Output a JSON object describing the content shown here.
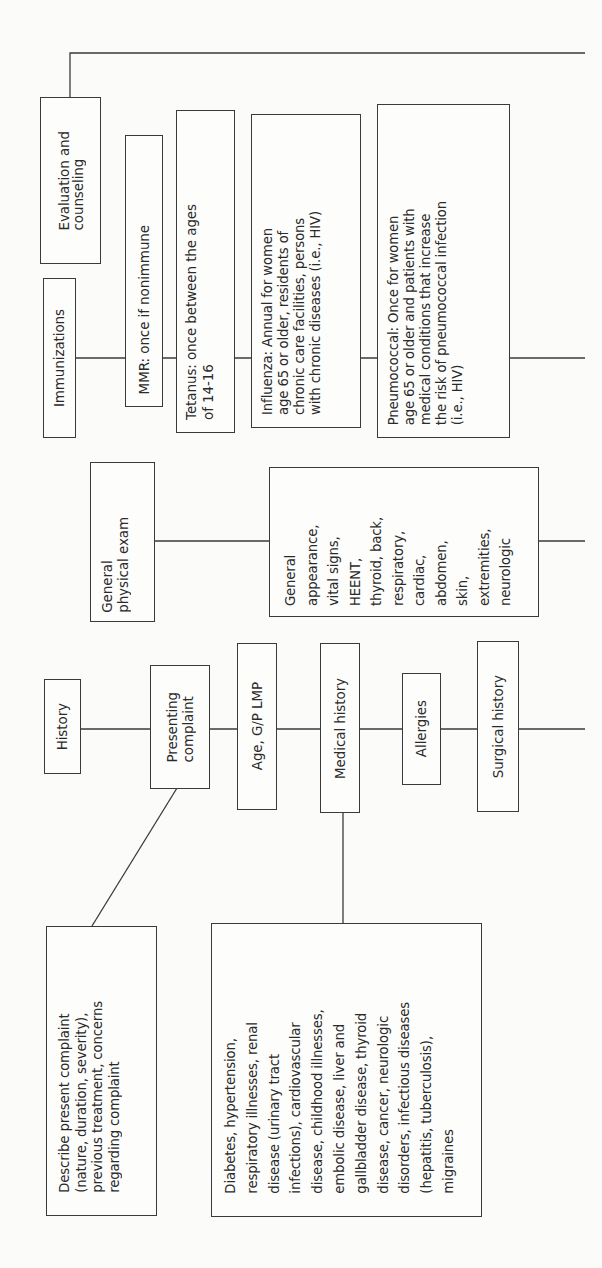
{
  "diagram": {
    "orientation": "rotated-90-ccw",
    "branches": [
      {
        "id": "evaluation",
        "title": "Evaluation and\ncounseling"
      },
      {
        "id": "immunizations",
        "title": "Immunizations",
        "items": [
          "MMR:  once if nonimmune",
          "Tetanus:  once between the ages\nof 14-16",
          "Influenza:  Annual for women\nage 65 or older,   residents of\nchronic care facilities, persons\nwith chronic diseases (i.e., HIV)",
          "Pneumococcal:  Once for women\nage 65 or older and patients with\nmedical conditions that increase\nthe risk of pneumococcal infection\n(i.e., HIV)"
        ]
      },
      {
        "id": "physical-exam",
        "title": "General\nphysical exam",
        "items": [
          "General\nappearance,\nvital signs,\nHEENT,\nthyroid, back,\nrespiratory,\ncardiac,\nabdomen,\nskin,\nextremities,\nneurologic"
        ]
      },
      {
        "id": "history",
        "title": "History",
        "items": [
          "Presenting\ncomplaint",
          "Age, G/P LMP",
          "Medical history",
          "Allergies",
          "Surgical history"
        ],
        "sub_items": {
          "presenting_complaint": "Describe present complaint\n(nature, duration, severity),\nprevious treatment, concerns\nregarding complaint",
          "medical_history": "Diabetes, hypertension,\nrespiratory illnesses, renal\ndisease (urinary tract\ninfections), cardiovascular\ndisease, childhood illnesses,\nembolic disease, liver and\ngallbladder disease, thyroid\ndisease, cancer, neurologic\ndisorders, infectious diseases\n(hepatitis, tuberculosis),\nmigraines"
        }
      }
    ]
  },
  "colors": {
    "line": "#3a3a3a",
    "background": "#fbfbfa",
    "text": "#2a2a2a"
  }
}
